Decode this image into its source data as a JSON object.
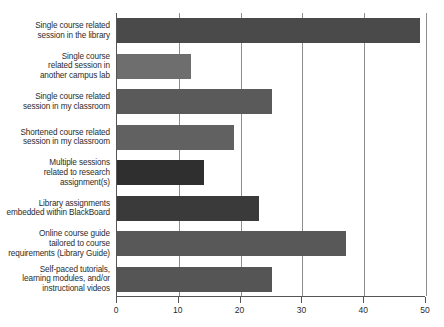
{
  "chart_data": {
    "type": "bar",
    "orientation": "horizontal",
    "title": "",
    "subtitle": "",
    "xlabel": "",
    "ylabel": "",
    "xlim": [
      0,
      50
    ],
    "ylim": null,
    "grid": true,
    "legend": null,
    "legend_position": "none",
    "xticks": [
      0,
      10,
      20,
      30,
      40,
      50
    ],
    "xtick_labels": [
      "0",
      "10",
      "20",
      "30",
      "40",
      "50"
    ],
    "categories": [
      "Single course related session in the library",
      "Single course related session in another campus lab",
      "Single course related session in my classroom",
      "Shortened course related session in my classroom",
      "Multiple sessions related to research assignment(s)",
      "Library assignments embedded within BlackBoard",
      "Online course guide tailored to course requirements (Library Guide)",
      "Self-paced tutorials, learning modules, and/or instructional videos"
    ],
    "category_label_lines": [
      [
        "Single course related",
        "session in the library"
      ],
      [
        "Single course",
        "related session in",
        "another campus lab"
      ],
      [
        "Single course related",
        "session in my classroom"
      ],
      [
        "Shortened course related",
        "session in my classroom"
      ],
      [
        "Multiple sessions",
        "related to research",
        "assignment(s)"
      ],
      [
        "Library assignments",
        "embedded within BlackBoard"
      ],
      [
        "Online course guide",
        "tailored to course",
        "requirements (Library Guide)"
      ],
      [
        "Self-paced tutorials,",
        "learning modules, and/or",
        "instructional videos"
      ]
    ],
    "values": [
      49,
      12,
      25,
      19,
      14,
      23,
      37,
      25
    ],
    "bar_colors": [
      "#4a4a4a",
      "#6e6e6e",
      "#5a5a5a",
      "#616161",
      "#2f2f2f",
      "#3a3a3a",
      "#585858",
      "#555555"
    ]
  },
  "axis": {
    "axis_color": "#555555",
    "grid_color": "#8d8d8d",
    "text_color": "#2b2b2b"
  }
}
